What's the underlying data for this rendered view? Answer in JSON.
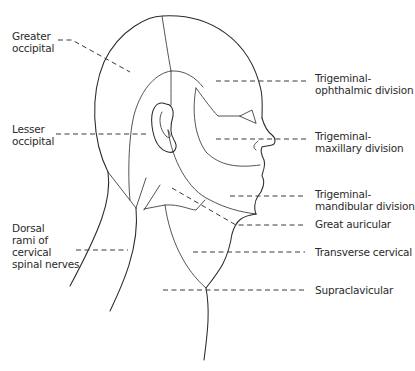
{
  "diagram": {
    "type": "anatomical-illustration",
    "labels": {
      "greater_occipital": "Greater\noccipital",
      "lesser_occipital": "Lesser\noccipital",
      "dorsal_rami": "Dorsal\nrami of\ncervical\nspinal nerves",
      "trigeminal_ophthalmic": "Trigeminal-\nophthalmic division",
      "trigeminal_maxillary": "Trigeminal-\nmaxillary division",
      "trigeminal_mandibular": "Trigeminal-\nmandibular division",
      "great_auricular": "Great auricular",
      "transverse_cervical": "Transverse cervical",
      "supraclavicular": "Supraclavicular"
    },
    "colors": {
      "line": "#2a2a2a",
      "text": "#2b2b2b",
      "background": "#ffffff"
    }
  }
}
